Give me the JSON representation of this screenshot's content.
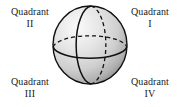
{
  "figure": {
    "background_color": "#ffffff",
    "text_color": "#1a1a1a"
  },
  "labels": {
    "quadrant_word": "Quadrant",
    "top_left": {
      "word": "Quadrant",
      "numeral": "II",
      "position": "top-left"
    },
    "top_right": {
      "word": "Quadrant",
      "numeral": "I",
      "position": "top-right"
    },
    "bottom_left": {
      "word": "Quadrant",
      "numeral": "III",
      "position": "bottom-left"
    },
    "bottom_right": {
      "word": "Quadrant",
      "numeral": "IV",
      "position": "bottom-right"
    }
  },
  "sphere": {
    "name": "shaded-sphere",
    "outline_color": "#111111",
    "fill_light": "#f2f2f2",
    "fill_mid": "#d4d4d4",
    "fill_dark": "#a8a8a8",
    "highlight_position": "upper-left",
    "center_x": 39,
    "center_y": 41,
    "radius_x": 37,
    "radius_y": 39,
    "curves": [
      {
        "name": "equator-front",
        "style": "solid",
        "orientation": "horizontal"
      },
      {
        "name": "equator-back",
        "style": "dashed",
        "orientation": "horizontal"
      },
      {
        "name": "meridian-front",
        "style": "solid",
        "orientation": "vertical"
      },
      {
        "name": "meridian-back",
        "style": "dashed",
        "orientation": "vertical"
      }
    ]
  }
}
